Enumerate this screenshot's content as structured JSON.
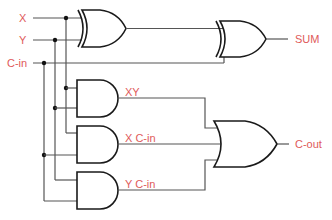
{
  "diagram": {
    "colors": {
      "label": "#e05a5a",
      "wire": "#555555",
      "gate": "#1a1a1a"
    },
    "inputs": [
      {
        "id": "x",
        "label": "X"
      },
      {
        "id": "y",
        "label": "Y"
      },
      {
        "id": "cin",
        "label": "C-in"
      }
    ],
    "intermediate": [
      {
        "id": "xy",
        "label": "XY"
      },
      {
        "id": "xcin",
        "label": "X C-in"
      },
      {
        "id": "ycin",
        "label": "Y C-in"
      }
    ],
    "outputs": [
      {
        "id": "sum",
        "label": "SUM"
      },
      {
        "id": "cout",
        "label": "C-out"
      }
    ],
    "gates": [
      {
        "id": "xor1",
        "type": "XOR",
        "inputs": [
          "X",
          "Y"
        ]
      },
      {
        "id": "xor2",
        "type": "XOR",
        "inputs": [
          "xor1",
          "C-in"
        ],
        "output": "SUM"
      },
      {
        "id": "and1",
        "type": "AND",
        "inputs": [
          "X",
          "Y"
        ],
        "output": "XY"
      },
      {
        "id": "and2",
        "type": "AND",
        "inputs": [
          "X",
          "C-in"
        ],
        "output": "X C-in"
      },
      {
        "id": "and3",
        "type": "AND",
        "inputs": [
          "Y",
          "C-in"
        ],
        "output": "Y C-in"
      },
      {
        "id": "or1",
        "type": "OR",
        "inputs": [
          "XY",
          "X C-in",
          "Y C-in"
        ],
        "output": "C-out"
      }
    ]
  }
}
